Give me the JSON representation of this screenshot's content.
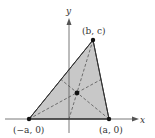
{
  "diagram": {
    "type": "triangle-centroid",
    "colors": {
      "fill": "#c8c8c8",
      "edge": "#333333",
      "axis": "#555555",
      "median": "#555555",
      "point": "#111111"
    },
    "axes": {
      "x_label": "x",
      "y_label": "y"
    },
    "vertices": [
      {
        "id": "left",
        "label": "(−a, 0)"
      },
      {
        "id": "right",
        "label": "(a, 0)"
      },
      {
        "id": "top",
        "label": "(b, c)"
      }
    ],
    "medians_style": "dashed",
    "centroid_marked": true
  }
}
